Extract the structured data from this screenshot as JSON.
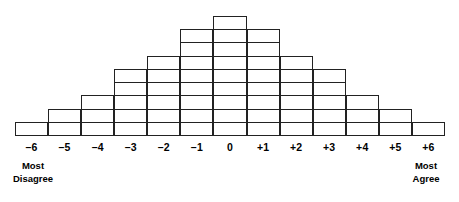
{
  "figure": {
    "name": "q-sort-distribution-grid",
    "line_color": "#222222",
    "background_color": "#ffffff"
  },
  "anchors": {
    "left": {
      "line1": "Most",
      "line2": "Disagree"
    },
    "right": {
      "line1": "Most",
      "line2": "Agree"
    }
  },
  "chart_data": {
    "type": "bar",
    "title": "",
    "subtitle": "",
    "xlabel": "",
    "ylabel": "",
    "grid": true,
    "legend": false,
    "orientation": "vertical",
    "note": "Q-sort forced quasi-normal distribution grid; each unit is an empty cell box stacked in a column.",
    "categories": [
      "-6",
      "-5",
      "-4",
      "-3",
      "-2",
      "-1",
      "0",
      "+1",
      "+2",
      "+3",
      "+4",
      "+5",
      "+6"
    ],
    "tick_labels": [
      "–6",
      "–5",
      "–4",
      "–3",
      "–2",
      "–1",
      "0",
      "+1",
      "+2",
      "+3",
      "+4",
      "+5",
      "+6"
    ],
    "values": [
      1,
      2,
      3,
      5,
      6,
      8,
      9,
      8,
      6,
      5,
      3,
      2,
      1
    ],
    "total_cells": 59,
    "ylim": [
      0,
      9
    ],
    "xlim_labels": [
      "-6",
      "+6"
    ],
    "annotations": [
      {
        "at": "-6",
        "text": "Most Disagree",
        "position": "below-axis-left"
      },
      {
        "at": "+6",
        "text": "Most Agree",
        "position": "below-axis-right"
      }
    ]
  }
}
